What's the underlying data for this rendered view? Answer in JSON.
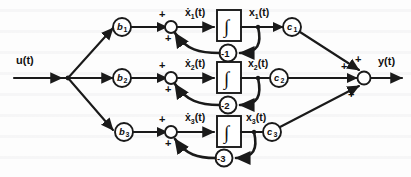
{
  "diagram": {
    "input": {
      "label": "u(t)"
    },
    "output": {
      "label": "y(t)"
    },
    "integrator_symbol": "∫",
    "plus_sign": "+",
    "branches": [
      {
        "id": "branch-1",
        "input_gain": "b",
        "input_gain_sub": "1",
        "derivative_label": "ẋ",
        "derivative_sub": "1",
        "derivative_suffix": "(t)",
        "state_label": "x",
        "state_sub": "1",
        "state_suffix": "(t)",
        "feedback_gain": "-1",
        "output_gain": "c",
        "output_gain_sub": "1"
      },
      {
        "id": "branch-2",
        "input_gain": "b",
        "input_gain_sub": "2",
        "derivative_label": "ẋ",
        "derivative_sub": "2",
        "derivative_suffix": "(t)",
        "state_label": "x",
        "state_sub": "2",
        "state_suffix": "(t)",
        "feedback_gain": "-2",
        "output_gain": "c",
        "output_gain_sub": "2"
      },
      {
        "id": "branch-3",
        "input_gain": "b",
        "input_gain_sub": "3",
        "derivative_label": "ẋ",
        "derivative_sub": "3",
        "derivative_suffix": "(t)",
        "state_label": "x",
        "state_sub": "3",
        "state_suffix": "(t)",
        "feedback_gain": "-3",
        "output_gain": "c",
        "output_gain_sub": "3"
      }
    ],
    "colors": {
      "ink": "#1a1a1a",
      "paper": "#fdfdfd"
    }
  }
}
